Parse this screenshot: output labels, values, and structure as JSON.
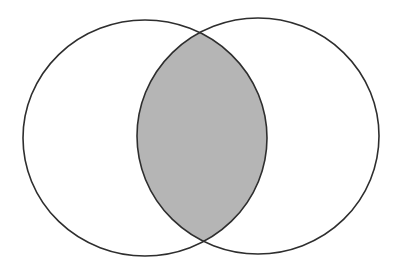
{
  "diagram": {
    "type": "venn",
    "sets": [
      {
        "id": "left-set",
        "cx": 145,
        "cy": 138,
        "rx": 122,
        "ry": 118
      },
      {
        "id": "right-set",
        "cx": 258,
        "cy": 136,
        "rx": 121,
        "ry": 118
      }
    ],
    "shaded_region": "intersection",
    "colors": {
      "background": "#ffffff",
      "stroke": "#2e2e2e",
      "intersection_fill": "#b5b5b5"
    },
    "stroke_width": 1.6
  }
}
